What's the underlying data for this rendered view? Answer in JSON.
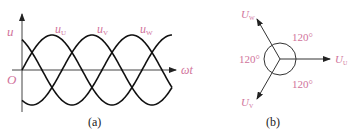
{
  "figure_a": {
    "y_axis_label": "u",
    "origin_label": "O",
    "x_axis_label": "ωt",
    "curves": [
      {
        "name": "u_U",
        "label_main": "u",
        "label_sub": "U",
        "phase_deg": 0
      },
      {
        "name": "u_V",
        "label_main": "u",
        "label_sub": "V",
        "phase_deg": -120
      },
      {
        "name": "u_W",
        "label_main": "u",
        "label_sub": "W",
        "phase_deg": 120
      }
    ],
    "caption": "(a)"
  },
  "figure_b": {
    "phasors": [
      {
        "name": "U_U",
        "label_main": "U",
        "label_sub": "U",
        "angle_deg": 0
      },
      {
        "name": "U_V",
        "label_main": "U",
        "label_sub": "V",
        "angle_deg": -120
      },
      {
        "name": "U_W",
        "label_main": "U",
        "label_sub": "W",
        "angle_deg": 120
      }
    ],
    "angles": [
      "120°",
      "120°",
      "120°"
    ],
    "caption": "(b)"
  },
  "colors": {
    "label": "#d0729a",
    "line": "#111111"
  }
}
